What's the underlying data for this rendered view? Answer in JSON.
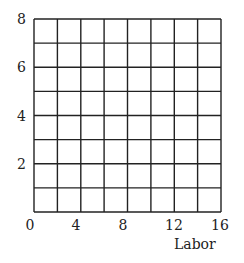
{
  "chart_data": {
    "type": "line",
    "title": "",
    "xlabel": "Labor",
    "ylabel": "",
    "xlim": [
      0,
      16
    ],
    "ylim": [
      0,
      8
    ],
    "x_ticks": [
      "0",
      "4",
      "8",
      "12",
      "16"
    ],
    "y_ticks": [
      "2",
      "4",
      "6",
      "8"
    ],
    "grid": true,
    "grid_x_step": 2,
    "grid_y_step": 1,
    "series": []
  },
  "axes": {
    "x_label": "Labor",
    "x_ticks": [
      {
        "label": "0",
        "value": 0
      },
      {
        "label": "4",
        "value": 4
      },
      {
        "label": "8",
        "value": 8
      },
      {
        "label": "12",
        "value": 12
      },
      {
        "label": "16",
        "value": 16
      }
    ],
    "y_ticks": [
      {
        "label": "2",
        "value": 2
      },
      {
        "label": "4",
        "value": 4
      },
      {
        "label": "6",
        "value": 6
      },
      {
        "label": "8",
        "value": 8
      }
    ]
  },
  "colors": {
    "grid_line": "#222222",
    "background": "#ffffff"
  }
}
